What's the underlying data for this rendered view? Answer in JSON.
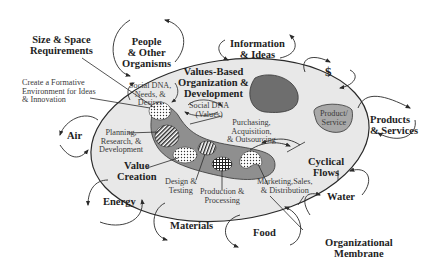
{
  "diagram": {
    "colors": {
      "membrane_fill": "#e8e8e8",
      "inner_blob_fill": "#8f8f8f",
      "dark_blob_fill": "#6e6e6e",
      "product_blob_fill": "#a8a8a8",
      "stroke": "#2a2a2a"
    },
    "external_labels": {
      "size_space": "Size & Space\nRequirements",
      "people": "People\n& Other\nOrganisms",
      "information": "Information\n& Ideas",
      "dollar": "$",
      "products_services": "Products\n& Services",
      "air": "Air",
      "energy": "Energy",
      "materials": "Materials",
      "food": "Food",
      "water": "Water",
      "membrane": "Organizational\nMembrane",
      "formative": "Create a Formative\nEnvironment for Ideas\n& Innovation"
    },
    "internal_labels": {
      "values_based": "Values-Based\nOrganization &\nDevelopment",
      "social_dna_needs": "Social DNA,\nNeeds, &\nDesires",
      "social_dna_values": "Social DNA\n(Values)",
      "planning": "Planning,\nResearch, &\nDevelopment",
      "purchasing": "Purchasing,\nAcquisition,\n& Outsourcing",
      "value_creation": "Value\nCreation",
      "design": "Design &\nTesting",
      "production": "Production &\nProcessing",
      "marketing": "Marketing,Sales,\n& Distribution",
      "cyclical": "Cyclical\nFlows",
      "product_service": "Product/\nService"
    }
  }
}
